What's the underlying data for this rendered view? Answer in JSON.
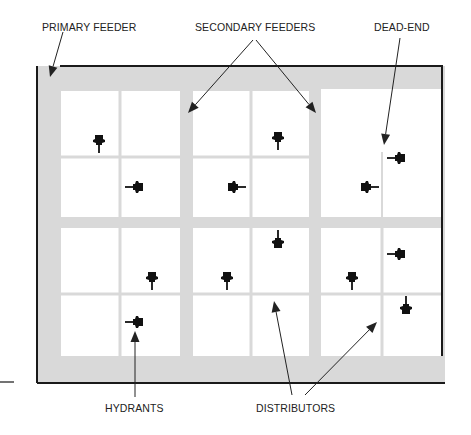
{
  "diagram": {
    "type": "water-distribution-grid",
    "labels": {
      "primary_feeder": "PRIMARY FEEDER",
      "secondary_feeders": "SECONDARY FEEDERS",
      "dead_end": "DEAD-END",
      "hydrants": "HYDRANTS",
      "distributors": "DISTRIBUTORS"
    },
    "colors": {
      "background": "#ffffff",
      "feeder_band": "#d9d9d9",
      "distributor_line": "#d9d9d9",
      "block_fill": "#ffffff",
      "border": "#1a1a1a",
      "hydrant": "#111111",
      "arrow": "#222222",
      "text": "#222222"
    },
    "frame": {
      "x": 37,
      "y": 66,
      "right": 442,
      "bottom": 383,
      "right_border_end": 356
    },
    "blocks": [
      {
        "name": "block-top-left",
        "x": 61,
        "y": 91,
        "w": 119,
        "h": 126,
        "vdiv": 120,
        "hdiv": 157
      },
      {
        "name": "block-top-middle",
        "x": 193,
        "y": 91,
        "w": 116,
        "h": 126,
        "vdiv": 251,
        "hdiv": 157
      },
      {
        "name": "block-top-right",
        "x": 321,
        "y": 89,
        "w": 121,
        "h": 128,
        "vdiv": 382,
        "hdiv": null,
        "dead_end_from": 152
      },
      {
        "name": "block-bottom-left",
        "x": 61,
        "y": 228,
        "w": 119,
        "h": 128,
        "vdiv": 120,
        "hdiv": 294
      },
      {
        "name": "block-bottom-middle",
        "x": 193,
        "y": 228,
        "w": 116,
        "h": 128,
        "vdiv": 251,
        "hdiv": 294
      },
      {
        "name": "block-bottom-right",
        "x": 321,
        "y": 228,
        "w": 121,
        "h": 128,
        "vdiv": 382,
        "hdiv": 294
      }
    ],
    "hydrants": [
      {
        "x": 99,
        "y": 143,
        "stem": "down"
      },
      {
        "x": 135,
        "y": 187,
        "stem": "left"
      },
      {
        "x": 278,
        "y": 140,
        "stem": "down"
      },
      {
        "x": 236,
        "y": 187,
        "stem": "right"
      },
      {
        "x": 397,
        "y": 158,
        "stem": "left"
      },
      {
        "x": 369,
        "y": 187,
        "stem": "right"
      },
      {
        "x": 278,
        "y": 240,
        "stem": "up"
      },
      {
        "x": 152,
        "y": 280,
        "stem": "down"
      },
      {
        "x": 227,
        "y": 280,
        "stem": "down"
      },
      {
        "x": 397,
        "y": 254,
        "stem": "left"
      },
      {
        "x": 352,
        "y": 280,
        "stem": "down"
      },
      {
        "x": 406,
        "y": 306,
        "stem": "up"
      },
      {
        "x": 135,
        "y": 322,
        "stem": "left"
      }
    ],
    "arrows": [
      {
        "name": "arrow-primary-feeder",
        "x1": 63,
        "y1": 32,
        "x2": 50,
        "y2": 77
      },
      {
        "name": "arrow-secondary-feeder-left",
        "x1": 253,
        "y1": 40,
        "x2": 188,
        "y2": 113
      },
      {
        "name": "arrow-secondary-feeder-right",
        "x1": 256,
        "y1": 40,
        "x2": 316,
        "y2": 113
      },
      {
        "name": "arrow-dead-end",
        "x1": 400,
        "y1": 38,
        "x2": 384,
        "y2": 145
      },
      {
        "name": "arrow-hydrants",
        "x1": 135,
        "y1": 397,
        "x2": 135,
        "y2": 331
      },
      {
        "name": "arrow-distributors-left",
        "x1": 292,
        "y1": 395,
        "x2": 274,
        "y2": 301
      },
      {
        "name": "arrow-distributors-right",
        "x1": 305,
        "y1": 395,
        "x2": 377,
        "y2": 322
      }
    ],
    "stub_line": {
      "x1": 0,
      "y1": 382,
      "x2": 14,
      "y2": 382
    }
  }
}
